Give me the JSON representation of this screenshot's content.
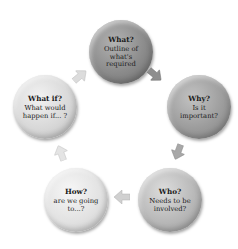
{
  "diagram": {
    "type": "cycle",
    "nodes": [
      {
        "title": "What?",
        "description": "Outline of what's required",
        "color": "#8a8a8a"
      },
      {
        "title": "Why?",
        "description": "Is it important?",
        "color": "#9c9c9c"
      },
      {
        "title": "Who?",
        "description": "Needs to be involved?",
        "color": "#b4b4b4"
      },
      {
        "title": "How?",
        "description": "are we going to...?",
        "color": "#dedede"
      },
      {
        "title": "What if?",
        "description": "What would happen if... ?",
        "color": "#d4d4d4"
      }
    ],
    "edges": [
      {
        "from": "What?",
        "to": "Why?"
      },
      {
        "from": "Why?",
        "to": "Who?"
      },
      {
        "from": "Who?",
        "to": "How?"
      },
      {
        "from": "How?",
        "to": "What if?"
      },
      {
        "from": "What if?",
        "to": "What?"
      }
    ]
  }
}
